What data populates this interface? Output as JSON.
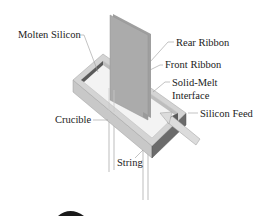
{
  "diagram": {
    "labels": {
      "molten_silicon": "Molten Silicon",
      "rear_ribbon": "Rear Ribbon",
      "front_ribbon": "Front Ribbon",
      "solid_melt_line1": "Solid-Melt",
      "solid_melt_line2": "Interface",
      "silicon_feed": "Silicon Feed",
      "crucible": "Crucible",
      "string": "String"
    },
    "colors": {
      "ribbon": "#a9a9a9",
      "ribbon_edge": "#8e8e8e",
      "crucible_top": "#d6d6d6",
      "crucible_side_light": "#c4c4c4",
      "crucible_side_dark": "#6a6a6a",
      "melt": "#f2f2f2",
      "inner_wall_dark": "#5a5a5a",
      "feed": "#d9d9d9",
      "leader": "#9a9a9a",
      "string": "#b8b8b8"
    }
  }
}
